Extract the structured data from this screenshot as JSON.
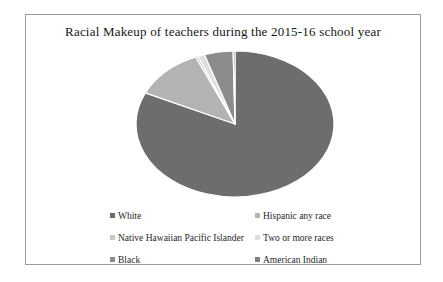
{
  "page": {
    "background": "#ffffff",
    "frame_border_color": "#9b9b9b"
  },
  "chart_data": {
    "type": "pie",
    "title": "Racial Makeup of teachers during the 2015-16 school year",
    "categories": [
      "White",
      "Hispanic any race",
      "Native Hawaiian Pacific Islander",
      "Two or more races",
      "Black",
      "American Indian"
    ],
    "values": [
      82,
      11.5,
      0.4,
      1.1,
      4.7,
      0.3
    ],
    "unit": "percent",
    "colors": [
      "#6d6d6d",
      "#b3b3b3",
      "#c8c8c8",
      "#dedede",
      "#8c8c8c",
      "#7f7f7f"
    ],
    "slice_separator_color": "#ffffff",
    "legend_position": "bottom",
    "legend_columns": 2,
    "start_angle_deg": 0,
    "direction": "clockwise"
  }
}
